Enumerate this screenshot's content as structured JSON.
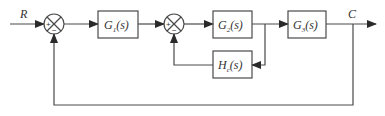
{
  "diagram": {
    "type": "control-system-block-diagram",
    "colors": {
      "line": "#4a4a4a",
      "box_border": "#4a4a4a",
      "text": "#333333",
      "background": "#ffffff"
    },
    "signals": {
      "input": "R",
      "output": "C"
    },
    "blocks": [
      {
        "id": "G1",
        "name": "G",
        "sub": "1",
        "arg": "(s)"
      },
      {
        "id": "G2",
        "name": "G",
        "sub": "2",
        "arg": "(s)"
      },
      {
        "id": "G3",
        "name": "G",
        "sub": "3",
        "arg": "(s)"
      },
      {
        "id": "Hc",
        "name": "H",
        "sub": "c",
        "arg": "(s)"
      }
    ],
    "summing_junctions": [
      {
        "id": "S1",
        "signs": {
          "left": "+",
          "bottom": "−"
        }
      },
      {
        "id": "S2",
        "signs": {
          "left": "+",
          "bottom": "−"
        }
      }
    ],
    "connections": [
      "R → S1(+)",
      "S1 → G1",
      "G1 → S2(+)",
      "S2 → G2",
      "G2 → G3",
      "G3 → C",
      "G2 output → Hc → S2(−)",
      "C → S1(−)"
    ]
  }
}
